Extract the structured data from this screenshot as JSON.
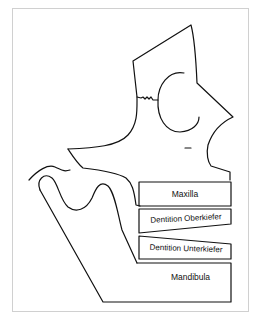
{
  "diagram": {
    "type": "anatomical-schematic",
    "stroke_color": "#111111",
    "frame_border_color": "#d0d0d0",
    "labels": [
      {
        "id": "maxilla",
        "text": "Maxilla"
      },
      {
        "id": "dentition_upper",
        "text": "Dentition Oberkiefer"
      },
      {
        "id": "dentition_lower",
        "text": "Dentition Unterkiefer"
      },
      {
        "id": "mandibula",
        "text": "Mandibula"
      }
    ]
  }
}
